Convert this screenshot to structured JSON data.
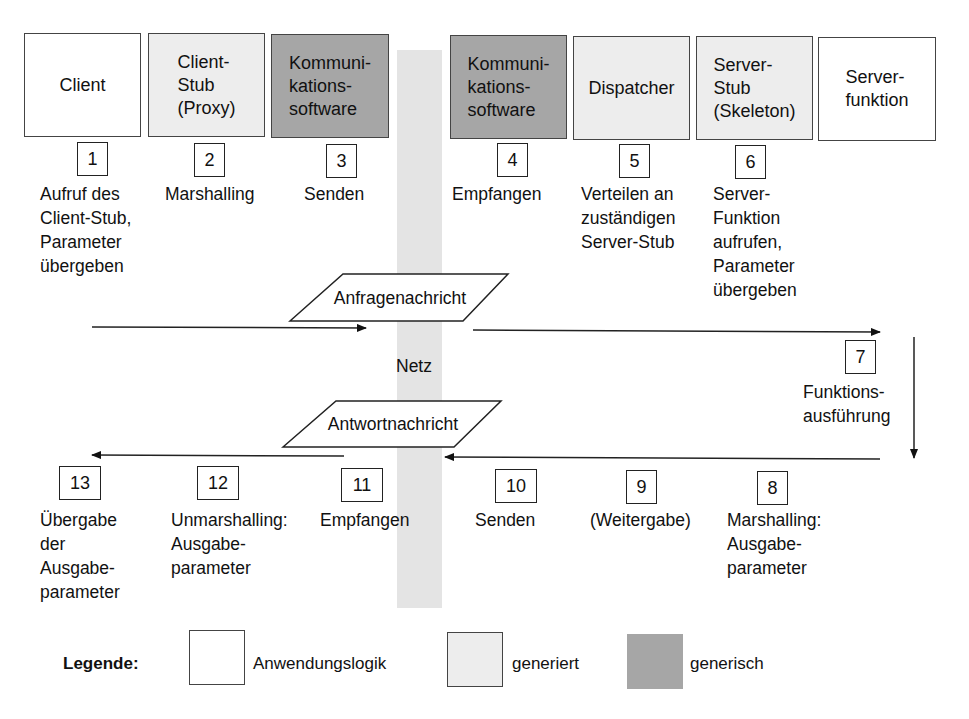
{
  "network": {
    "label": "Netz",
    "color": "#e4e4e4"
  },
  "components": [
    {
      "id": "client",
      "label": "Client",
      "category": "app"
    },
    {
      "id": "client-stub",
      "label": "Client-\nStub\n(Proxy)",
      "category": "generated"
    },
    {
      "id": "comm-client",
      "label": "Kommuni-\nkations-\nsoftware",
      "category": "generic"
    },
    {
      "id": "comm-server",
      "label": "Kommuni-\nkations-\nsoftware",
      "category": "generic"
    },
    {
      "id": "dispatcher",
      "label": "Dispatcher",
      "category": "generated"
    },
    {
      "id": "server-stub",
      "label": "Server-\nStub\n(Skeleton)",
      "category": "generated"
    },
    {
      "id": "server-function",
      "label": "Server-\nfunktion",
      "category": "app"
    }
  ],
  "request_steps": [
    {
      "num": "1",
      "text": "Aufruf des\nClient-Stub,\nParameter\nübergeben"
    },
    {
      "num": "2",
      "text": "Marshalling"
    },
    {
      "num": "3",
      "text": "Senden"
    },
    {
      "num": "4",
      "text": "Empfangen"
    },
    {
      "num": "5",
      "text": "Verteilen an\nzuständigen\nServer-Stub"
    },
    {
      "num": "6",
      "text": "Server-\nFunktion\naufrufen,\nParameter\nübergeben"
    },
    {
      "num": "7",
      "text": "Funktions-\nausführung"
    }
  ],
  "response_steps": [
    {
      "num": "13",
      "text": "Übergabe\nder\nAusgabe-\nparameter"
    },
    {
      "num": "12",
      "text": "Unmarshalling:\nAusgabe-\nparameter"
    },
    {
      "num": "11",
      "text": "Empfangen"
    },
    {
      "num": "10",
      "text": "Senden"
    },
    {
      "num": "9",
      "text": "(Weitergabe)"
    },
    {
      "num": "8",
      "text": "Marshalling:\nAusgabe-\nparameter"
    }
  ],
  "messages": {
    "request": "Anfragenachricht",
    "response": "Antwortnachricht"
  },
  "legend": {
    "title": "Legende:",
    "items": [
      {
        "label": "Anwendungslogik",
        "color": "#ffffff"
      },
      {
        "label": "generiert",
        "color": "#ededed"
      },
      {
        "label": "generisch",
        "color": "#a6a6a6"
      }
    ]
  }
}
